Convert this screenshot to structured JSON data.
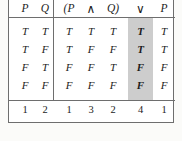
{
  "figure": {
    "type": "truth-table",
    "background_color": "#fbfbf9",
    "table_background": "#ffffff",
    "border_color": "#6e6e6e",
    "highlight_color": "#cdcdcd",
    "highlighted_column_index": 3,
    "highlighted_column_label": "∨"
  },
  "header": {
    "left_group": [
      "P",
      "Q"
    ],
    "formula_tokens": [
      "(P",
      "∧",
      "Q)",
      "∨",
      "P"
    ]
  },
  "rows": [
    {
      "p": "T",
      "q": "T",
      "formula_values": [
        "T",
        "T",
        "T",
        "T",
        "T"
      ]
    },
    {
      "p": "T",
      "q": "F",
      "formula_values": [
        "T",
        "F",
        "F",
        "T",
        "T"
      ]
    },
    {
      "p": "F",
      "q": "T",
      "formula_values": [
        "F",
        "F",
        "T",
        "F",
        "F"
      ]
    },
    {
      "p": "F",
      "q": "F",
      "formula_values": [
        "F",
        "F",
        "F",
        "F",
        "F"
      ]
    }
  ],
  "order_row": {
    "left_group": [
      "1",
      "2"
    ],
    "formula_order": [
      "1",
      "3",
      "2",
      "4",
      "1"
    ]
  }
}
